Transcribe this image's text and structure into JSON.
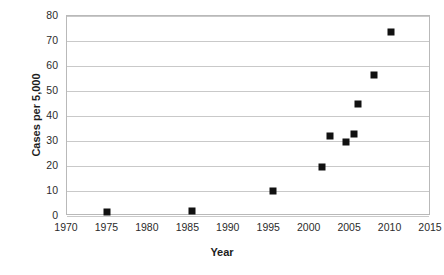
{
  "chart_data": {
    "type": "scatter",
    "title": "",
    "xlabel": "Year",
    "ylabel": "Cases per 5,000",
    "xlim": [
      1970,
      2015
    ],
    "ylim": [
      0,
      80
    ],
    "xticks": [
      1970,
      1975,
      1980,
      1985,
      1990,
      1995,
      2000,
      2005,
      2010,
      2015
    ],
    "yticks": [
      0,
      10,
      20,
      30,
      40,
      50,
      60,
      70,
      80
    ],
    "xtick_labels": [
      "1970",
      "1975",
      "1980",
      "1985",
      "1990",
      "1995",
      "2000",
      "2005",
      "2010",
      "2015"
    ],
    "ytick_labels": [
      "0",
      "10",
      "20",
      "30",
      "40",
      "50",
      "60",
      "70",
      "80"
    ],
    "grid": "horizontal",
    "legend": "none",
    "marker": "filled-square",
    "marker_color": "#111111",
    "series": [
      {
        "name": "Cases per 5,000",
        "points": [
          {
            "x": 1975.0,
            "y": 1.5
          },
          {
            "x": 1985.5,
            "y": 2.0
          },
          {
            "x": 1995.5,
            "y": 10.0
          },
          {
            "x": 2001.5,
            "y": 19.5
          },
          {
            "x": 2002.5,
            "y": 32.0
          },
          {
            "x": 2004.5,
            "y": 29.5
          },
          {
            "x": 2005.5,
            "y": 33.0
          },
          {
            "x": 2006.0,
            "y": 45.0
          },
          {
            "x": 2008.0,
            "y": 56.5
          },
          {
            "x": 2010.0,
            "y": 73.5
          }
        ]
      }
    ]
  },
  "colors": {
    "background": "#ffffff",
    "gridline": "#c9c9c9",
    "frame": "#b9b9b9",
    "marker": "#111111",
    "text": "#2b2b2b"
  }
}
